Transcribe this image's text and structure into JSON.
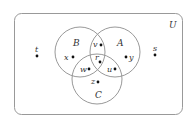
{
  "diagram": {
    "type": "venn",
    "universe_label": "U",
    "sets": [
      {
        "name": "A",
        "label": "A"
      },
      {
        "name": "B",
        "label": "B"
      },
      {
        "name": "C",
        "label": "C"
      }
    ],
    "elements": [
      {
        "label": "t",
        "region": "outside"
      },
      {
        "label": "s",
        "region": "outside"
      },
      {
        "label": "x",
        "region": "B only"
      },
      {
        "label": "y",
        "region": "A only"
      },
      {
        "label": "v",
        "region": "A and B only"
      },
      {
        "label": "r",
        "region": "A and B and C"
      },
      {
        "label": "w",
        "region": "B and C only"
      },
      {
        "label": "u",
        "region": "A and C only"
      },
      {
        "label": "z",
        "region": "C only"
      }
    ],
    "colors": {
      "stroke": "#999999",
      "text": "#333333",
      "dot": "#111111"
    }
  }
}
